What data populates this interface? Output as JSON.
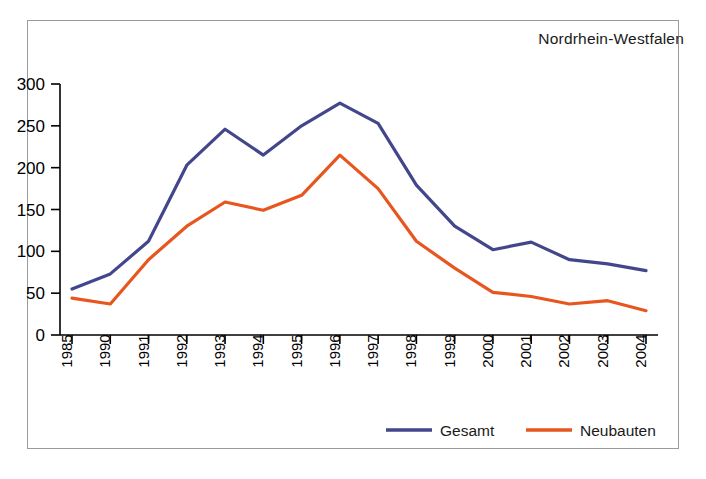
{
  "figure": {
    "title": "Nordrhein-Westfalen",
    "frame_color": "#9b9b9b",
    "background": "#ffffff"
  },
  "legend": {
    "position": "bottom-right",
    "entries": [
      {
        "label": "Gesamt",
        "color": "#43468a"
      },
      {
        "label": "Neubauten",
        "color": "#e8561f"
      }
    ]
  },
  "axes": {
    "y_ticks": [
      "0",
      "50",
      "100",
      "150",
      "200",
      "250",
      "300"
    ],
    "x_ticks": [
      "1985",
      "1990",
      "1991",
      "1992",
      "1993",
      "1994",
      "1995",
      "1996",
      "1997",
      "1998",
      "1999",
      "2000",
      "2001",
      "2002",
      "2003",
      "2004"
    ]
  },
  "chart_data": {
    "type": "line",
    "title": "Nordrhein-Westfalen",
    "xlabel": "",
    "ylabel": "",
    "ylim": [
      0,
      300
    ],
    "ytick_step": 50,
    "grid": false,
    "legend_position": "bottom-right",
    "categories": [
      "1985",
      "1990",
      "1991",
      "1992",
      "1993",
      "1994",
      "1995",
      "1996",
      "1997",
      "1998",
      "1999",
      "2000",
      "2001",
      "2002",
      "2003",
      "2004"
    ],
    "series": [
      {
        "name": "Gesamt",
        "color": "#43468a",
        "values": [
          55,
          73,
          112,
          203,
          246,
          215,
          250,
          277,
          253,
          179,
          130,
          102,
          111,
          90,
          85,
          77
        ]
      },
      {
        "name": "Neubauten",
        "color": "#e8561f",
        "values": [
          44,
          37,
          90,
          130,
          159,
          149,
          167,
          215,
          175,
          112,
          80,
          51,
          46,
          37,
          41,
          29
        ]
      }
    ]
  }
}
